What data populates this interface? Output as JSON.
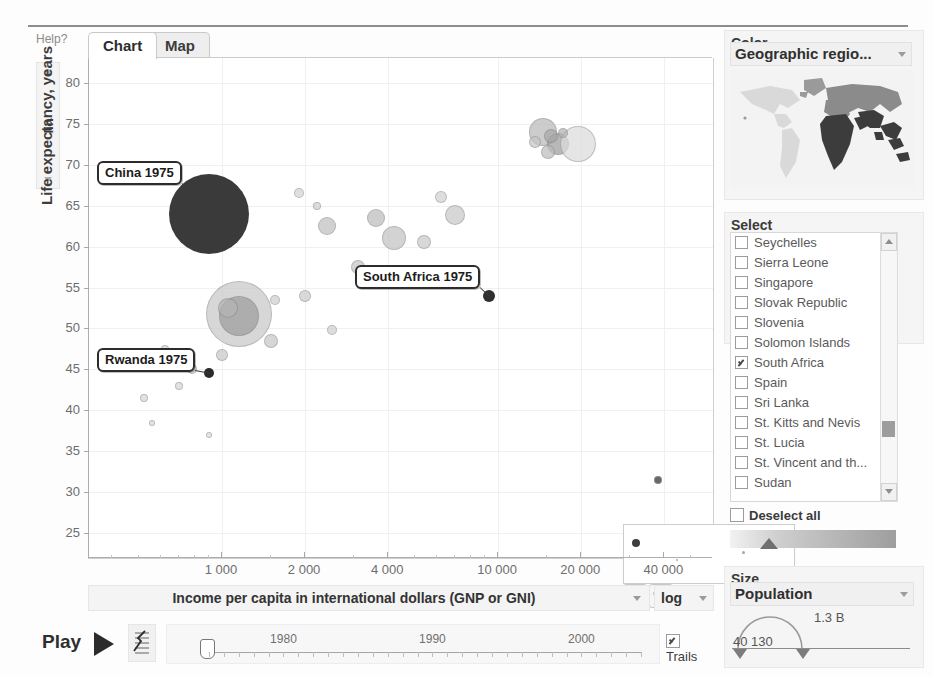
{
  "window": {
    "help_label": "Help?"
  },
  "tabs": [
    {
      "label": "Chart",
      "selected": true
    },
    {
      "label": "Map",
      "selected": false
    }
  ],
  "yaxis": {
    "title": "Life expectancy, years",
    "scale_label": "lin",
    "ticks": [
      80,
      75,
      70,
      65,
      60,
      55,
      50,
      45,
      40,
      35,
      30,
      25
    ],
    "min": 22,
    "max": 83
  },
  "xaxis": {
    "selector_label": "Income per capita in international dollars (GNP or GNI)",
    "scale_label": "log",
    "ticks": [
      "1 000",
      "2 000",
      "4 000",
      "10 000",
      "20 000",
      "40 000"
    ],
    "tick_values": [
      1000,
      2000,
      4000,
      10000,
      20000,
      40000
    ]
  },
  "callouts": [
    {
      "label": "China 1975"
    },
    {
      "label": "South Africa 1975"
    },
    {
      "label": "Rwanda 1975"
    }
  ],
  "zoom_controls": {
    "zoom_in_name": "zoom-in",
    "zoom_out_name": "zoom-out",
    "zoom_level": "100%"
  },
  "playback": {
    "play_label": "Play",
    "year_labels": [
      "1980",
      "1990",
      "2000"
    ],
    "current_year": "1975",
    "trails_label": "Trails",
    "trails_checked": true
  },
  "color_panel": {
    "title": "Color",
    "selected": "Geographic regio...",
    "icon": "world-map"
  },
  "select_panel": {
    "title": "Select",
    "items": [
      {
        "label": "Seychelles",
        "checked": false
      },
      {
        "label": "Sierra Leone",
        "checked": false
      },
      {
        "label": "Singapore",
        "checked": false
      },
      {
        "label": "Slovak Republic",
        "checked": false
      },
      {
        "label": "Slovenia",
        "checked": false
      },
      {
        "label": "Solomon Islands",
        "checked": false
      },
      {
        "label": "South Africa",
        "checked": true
      },
      {
        "label": "Spain",
        "checked": false
      },
      {
        "label": "Sri Lanka",
        "checked": false
      },
      {
        "label": "St. Kitts and Nevis",
        "checked": false
      },
      {
        "label": "St. Lucia",
        "checked": false
      },
      {
        "label": "St. Vincent and th...",
        "checked": false
      },
      {
        "label": "Sudan",
        "checked": false
      }
    ],
    "deselect_all_label": "Deselect all",
    "deselect_all_checked": false
  },
  "size_panel": {
    "title": "Size",
    "selected": "Population",
    "max_value": "1.3 B",
    "min_value": "40 130"
  },
  "chart_data": {
    "type": "scatter",
    "title": "",
    "xlabel": "Income per capita in international dollars (GNP or GNI)",
    "ylabel": "Life expectancy, years",
    "xscale": "log",
    "yscale": "linear",
    "xlim": [
      330,
      60000
    ],
    "ylim": [
      22,
      83
    ],
    "xticks": [
      1000,
      2000,
      4000,
      10000,
      20000,
      40000
    ],
    "yticks": [
      25,
      30,
      35,
      40,
      45,
      50,
      55,
      60,
      65,
      70,
      75,
      80
    ],
    "grid": true,
    "legend": "none",
    "size_encodes": "Population",
    "color_encodes": "Geographic region",
    "year": 1975,
    "annotations": [
      {
        "text": "China 1975",
        "x": 900,
        "y": 64,
        "highlight": true
      },
      {
        "text": "South Africa 1975",
        "x": 9300,
        "y": 54,
        "highlight": true
      },
      {
        "text": "Rwanda 1975",
        "x": 900,
        "y": 44.5,
        "highlight": true
      }
    ],
    "points": [
      {
        "x": 900,
        "y": 64.0,
        "r": 40,
        "c": "#3a3a3a",
        "highlight": true,
        "name": "China"
      },
      {
        "x": 9300,
        "y": 54.0,
        "r": 6,
        "c": "#2f2f2f",
        "highlight": true,
        "name": "South Africa"
      },
      {
        "x": 900,
        "y": 44.6,
        "r": 5,
        "c": "#2b2b2b",
        "highlight": true,
        "name": "Rwanda"
      },
      {
        "x": 1150,
        "y": 51.8,
        "r": 33,
        "c": "#c9c9c9"
      },
      {
        "x": 1150,
        "y": 51.5,
        "r": 20,
        "c": "#9e9e9e"
      },
      {
        "x": 1050,
        "y": 52.5,
        "r": 10,
        "c": "#b4b4b4"
      },
      {
        "x": 14500,
        "y": 74.0,
        "r": 14,
        "c": "#b9b9b9"
      },
      {
        "x": 16500,
        "y": 72.5,
        "r": 11,
        "c": "#9d9d9d"
      },
      {
        "x": 19500,
        "y": 72.5,
        "r": 18,
        "c": "#dcdcdc"
      },
      {
        "x": 15500,
        "y": 73.5,
        "r": 7,
        "c": "#a9a9a9"
      },
      {
        "x": 17200,
        "y": 73.8,
        "r": 5,
        "c": "#b0b0b0"
      },
      {
        "x": 13600,
        "y": 72.7,
        "r": 6,
        "c": "#c6c6c6"
      },
      {
        "x": 15200,
        "y": 71.5,
        "r": 7,
        "c": "#bdbdbd"
      },
      {
        "x": 2400,
        "y": 62.5,
        "r": 9,
        "c": "#c0c0c0"
      },
      {
        "x": 3600,
        "y": 63.5,
        "r": 9,
        "c": "#bcbcbc"
      },
      {
        "x": 4200,
        "y": 61.0,
        "r": 12,
        "c": "#c3c3c3"
      },
      {
        "x": 5400,
        "y": 60.5,
        "r": 7,
        "c": "#cacaca"
      },
      {
        "x": 7000,
        "y": 63.8,
        "r": 10,
        "c": "#c8c8c8"
      },
      {
        "x": 6200,
        "y": 66.0,
        "r": 6,
        "c": "#d2d2d2"
      },
      {
        "x": 1900,
        "y": 66.5,
        "r": 5,
        "c": "#d4d4d4"
      },
      {
        "x": 2200,
        "y": 65.0,
        "r": 4,
        "c": "#d0d0d0"
      },
      {
        "x": 3100,
        "y": 57.5,
        "r": 7,
        "c": "#c4c4c4"
      },
      {
        "x": 2000,
        "y": 54.0,
        "r": 6,
        "c": "#cbcbcb"
      },
      {
        "x": 1550,
        "y": 53.5,
        "r": 5,
        "c": "#cfcfcf"
      },
      {
        "x": 1500,
        "y": 48.5,
        "r": 7,
        "c": "#c7c7c7"
      },
      {
        "x": 2500,
        "y": 49.8,
        "r": 5,
        "c": "#d1d1d1"
      },
      {
        "x": 1000,
        "y": 46.8,
        "r": 6,
        "c": "#c9c9c9"
      },
      {
        "x": 780,
        "y": 45.0,
        "r": 5,
        "c": "#cdcdcd"
      },
      {
        "x": 700,
        "y": 43.0,
        "r": 4,
        "c": "#d6d6d6"
      },
      {
        "x": 620,
        "y": 47.5,
        "r": 4,
        "c": "#d3d3d3"
      },
      {
        "x": 520,
        "y": 41.5,
        "r": 4,
        "c": "#d8d8d8"
      },
      {
        "x": 560,
        "y": 38.5,
        "r": 3,
        "c": "#dadada"
      },
      {
        "x": 900,
        "y": 37.0,
        "r": 3,
        "c": "#dcdcdc"
      },
      {
        "x": 38000,
        "y": 31.5,
        "r": 4,
        "c": "#2f2f2f"
      }
    ]
  }
}
